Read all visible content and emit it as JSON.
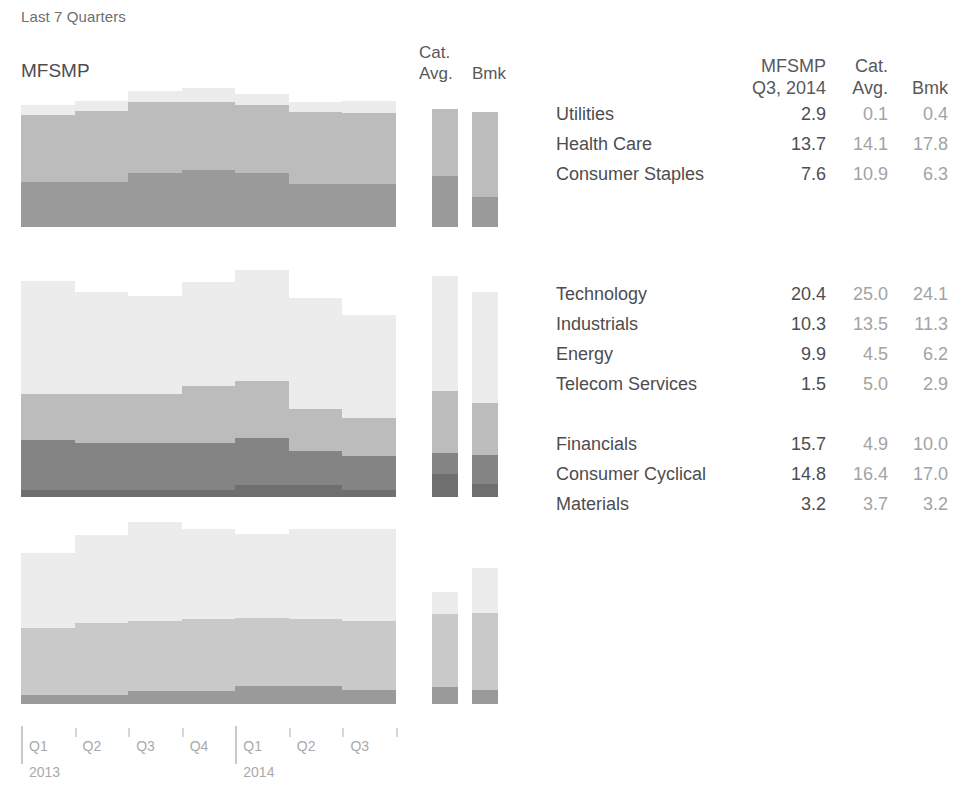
{
  "header": {
    "title": "Last 7 Quarters",
    "portfolio_label": "MFSMP",
    "cat_avg_label_line1": "Cat.",
    "cat_avg_label_line2": "Avg.",
    "bmk_label": "Bmk"
  },
  "table": {
    "columns": [
      {
        "key": "sector",
        "line1": "",
        "line2": ""
      },
      {
        "key": "mfsmp",
        "line1": "MFSMP",
        "line2": "Q3, 2014"
      },
      {
        "key": "cat_avg",
        "line1": "Cat.",
        "line2": "Avg."
      },
      {
        "key": "bmk",
        "line1": "",
        "line2": "Bmk"
      }
    ],
    "groups": [
      {
        "name": "defensive",
        "rows": [
          {
            "sector": "Utilities",
            "mfsmp": "2.9",
            "cat_avg": "0.1",
            "bmk": "0.4"
          },
          {
            "sector": "Health Care",
            "mfsmp": "13.7",
            "cat_avg": "14.1",
            "bmk": "17.8"
          },
          {
            "sector": "Consumer Staples",
            "mfsmp": "7.6",
            "cat_avg": "10.9",
            "bmk": "6.3"
          }
        ]
      },
      {
        "name": "sensitive",
        "rows": [
          {
            "sector": "Technology",
            "mfsmp": "20.4",
            "cat_avg": "25.0",
            "bmk": "24.1"
          },
          {
            "sector": "Industrials",
            "mfsmp": "10.3",
            "cat_avg": "13.5",
            "bmk": "11.3"
          },
          {
            "sector": "Energy",
            "mfsmp": "9.9",
            "cat_avg": "4.5",
            "bmk": "6.2"
          },
          {
            "sector": "Telecom Services",
            "mfsmp": "1.5",
            "cat_avg": "5.0",
            "bmk": "2.9"
          }
        ]
      },
      {
        "name": "cyclical",
        "rows": [
          {
            "sector": "Financials",
            "mfsmp": "15.7",
            "cat_avg": "4.9",
            "bmk": "10.0"
          },
          {
            "sector": "Consumer Cyclical",
            "mfsmp": "14.8",
            "cat_avg": "16.4",
            "bmk": "17.0"
          },
          {
            "sector": "Materials",
            "mfsmp": "3.2",
            "cat_avg": "3.7",
            "bmk": "3.2"
          }
        ]
      }
    ]
  },
  "axis": {
    "quarters": [
      {
        "label": "Q1",
        "year": "2013",
        "major": true
      },
      {
        "label": "Q2",
        "year": "",
        "major": false
      },
      {
        "label": "Q3",
        "year": "",
        "major": false
      },
      {
        "label": "Q4",
        "year": "",
        "major": false
      },
      {
        "label": "Q1",
        "year": "2014",
        "major": true
      },
      {
        "label": "Q2",
        "year": "",
        "major": false
      },
      {
        "label": "Q3",
        "year": "",
        "major": false
      }
    ]
  },
  "colors": {
    "band_lightest": "#ececec",
    "band_light": "#d6d6d6",
    "band_mid": "#bcbcbc",
    "band_dark": "#9a9a9a",
    "band_darkest": "#848484",
    "band_deepest": "#6f6f6f",
    "text_primary": "#4d4d4f",
    "text_muted": "#a3a3a5",
    "axis_line": "#c9c9cb",
    "background": "#ffffff"
  },
  "chart_data": {
    "type": "area",
    "title": "Last 7 Quarters",
    "xlabel": "",
    "ylabel": "",
    "stacked": true,
    "percent_scale": true,
    "x": [
      "Q1 2013",
      "Q2 2013",
      "Q3 2013",
      "Q4 2013",
      "Q1 2014",
      "Q2 2014",
      "Q3 2014"
    ],
    "panels": [
      {
        "name": "defensive",
        "pixel_top": 86,
        "pixel_bottom": 227,
        "total_max": 30,
        "series": [
          {
            "name": "Consumer Staples",
            "color": "#9a9a9a",
            "values": [
              9.5,
              9.5,
              11.5,
              12.2,
              11.5,
              9.2,
              9.2
            ]
          },
          {
            "name": "Health Care",
            "color": "#bcbcbc",
            "values": [
              14.3,
              15.2,
              15.0,
              14.5,
              14.5,
              15.3,
              15.0
            ]
          },
          {
            "name": "Utilities",
            "color": "#ececec",
            "values": [
              2.2,
              2.2,
              2.5,
              2.8,
              2.2,
              2.2,
              2.6
            ]
          }
        ]
      },
      {
        "name": "sensitive",
        "pixel_top": 244,
        "pixel_bottom": 497,
        "total_max": 55,
        "series": [
          {
            "name": "Telecom Services",
            "color": "#6f6f6f",
            "values": [
              1.5,
              1.5,
              1.5,
              1.5,
              2.6,
              2.6,
              1.5
            ]
          },
          {
            "name": "Energy",
            "color": "#848484",
            "values": [
              11.0,
              10.2,
              10.2,
              10.2,
              10.2,
              7.5,
              7.5
            ]
          },
          {
            "name": "Industrials",
            "color": "#bcbcbc",
            "values": [
              10.0,
              10.7,
              10.7,
              12.4,
              12.4,
              9.0,
              8.2
            ]
          },
          {
            "name": "Technology",
            "color": "#ececec",
            "values": [
              24.5,
              22.2,
              21.4,
              22.6,
              24.2,
              24.2,
              22.4
            ]
          }
        ]
      },
      {
        "name": "cyclical",
        "pixel_top": 515,
        "pixel_bottom": 704,
        "total_max": 42,
        "series": [
          {
            "name": "Materials",
            "color": "#9a9a9a",
            "values": [
              2.0,
              2.0,
              3.0,
              3.0,
              4.0,
              4.0,
              3.2
            ]
          },
          {
            "name": "Consumer Cyclical",
            "color": "#c9c9c9",
            "values": [
              15.0,
              16.0,
              15.5,
              15.8,
              15.2,
              15.0,
              15.2
            ]
          },
          {
            "name": "Financials",
            "color": "#ececec",
            "values": [
              16.5,
              19.5,
              22.0,
              20.0,
              18.5,
              20.0,
              20.5
            ]
          }
        ]
      }
    ],
    "cat_avg_bars": [
      {
        "panel": "defensive",
        "segments": [
          {
            "name": "Consumer Staples",
            "color": "#9a9a9a",
            "value": 10.9
          },
          {
            "name": "Health Care",
            "color": "#bcbcbc",
            "value": 14.1
          },
          {
            "name": "Utilities",
            "color": "#bcbcbc",
            "value": 0.1
          }
        ]
      },
      {
        "panel": "sensitive",
        "segments": [
          {
            "name": "Telecom Services",
            "color": "#6f6f6f",
            "value": 5.0
          },
          {
            "name": "Energy",
            "color": "#848484",
            "value": 4.5
          },
          {
            "name": "Industrials",
            "color": "#bcbcbc",
            "value": 13.5
          },
          {
            "name": "Technology",
            "color": "#ececec",
            "value": 25.0
          }
        ]
      },
      {
        "panel": "cyclical",
        "segments": [
          {
            "name": "Materials",
            "color": "#9a9a9a",
            "value": 3.7
          },
          {
            "name": "Consumer Cyclical",
            "color": "#c9c9c9",
            "value": 16.4
          },
          {
            "name": "Financials",
            "color": "#ececec",
            "value": 4.9
          }
        ]
      }
    ],
    "bmk_bars": [
      {
        "panel": "defensive",
        "segments": [
          {
            "name": "Consumer Staples",
            "color": "#9a9a9a",
            "value": 6.3
          },
          {
            "name": "Health Care",
            "color": "#bcbcbc",
            "value": 17.8
          },
          {
            "name": "Utilities",
            "color": "#bcbcbc",
            "value": 0.4
          }
        ]
      },
      {
        "panel": "sensitive",
        "segments": [
          {
            "name": "Telecom Services",
            "color": "#6f6f6f",
            "value": 2.9
          },
          {
            "name": "Energy",
            "color": "#848484",
            "value": 6.2
          },
          {
            "name": "Industrials",
            "color": "#bcbcbc",
            "value": 11.3
          },
          {
            "name": "Technology",
            "color": "#ececec",
            "value": 24.1
          }
        ]
      },
      {
        "panel": "cyclical",
        "segments": [
          {
            "name": "Materials",
            "color": "#9a9a9a",
            "value": 3.2
          },
          {
            "name": "Consumer Cyclical",
            "color": "#c9c9c9",
            "value": 17.0
          },
          {
            "name": "Financials",
            "color": "#ececec",
            "value": 10.0
          }
        ]
      }
    ]
  }
}
